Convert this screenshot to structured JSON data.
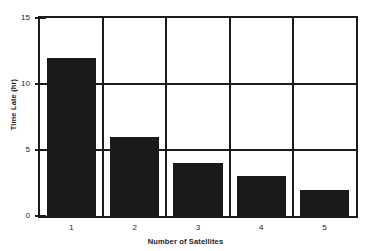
{
  "chart_data": {
    "type": "bar",
    "title": "",
    "subtitle": "",
    "categories": [
      "1",
      "2",
      "3",
      "4",
      "5"
    ],
    "values": [
      12,
      6,
      4,
      3,
      2
    ],
    "series": [
      {
        "name": "Time Late",
        "values": [
          12,
          6,
          4,
          3,
          2
        ]
      }
    ],
    "xlabel": "Number of Satellites",
    "ylabel": "Time Late (hr)",
    "ylim": [
      0,
      15
    ],
    "yticks": [
      "0",
      "5",
      "10",
      "15"
    ],
    "ytick_values": [
      0,
      5,
      10,
      15
    ],
    "xticks": [
      "1",
      "2",
      "3",
      "4",
      "5"
    ],
    "grid": "horizontal-and-vertical",
    "legend": "none",
    "bar_color": "#1a1a1a",
    "axis_color": "#1b1b1b",
    "background_color": "#ffffff"
  }
}
